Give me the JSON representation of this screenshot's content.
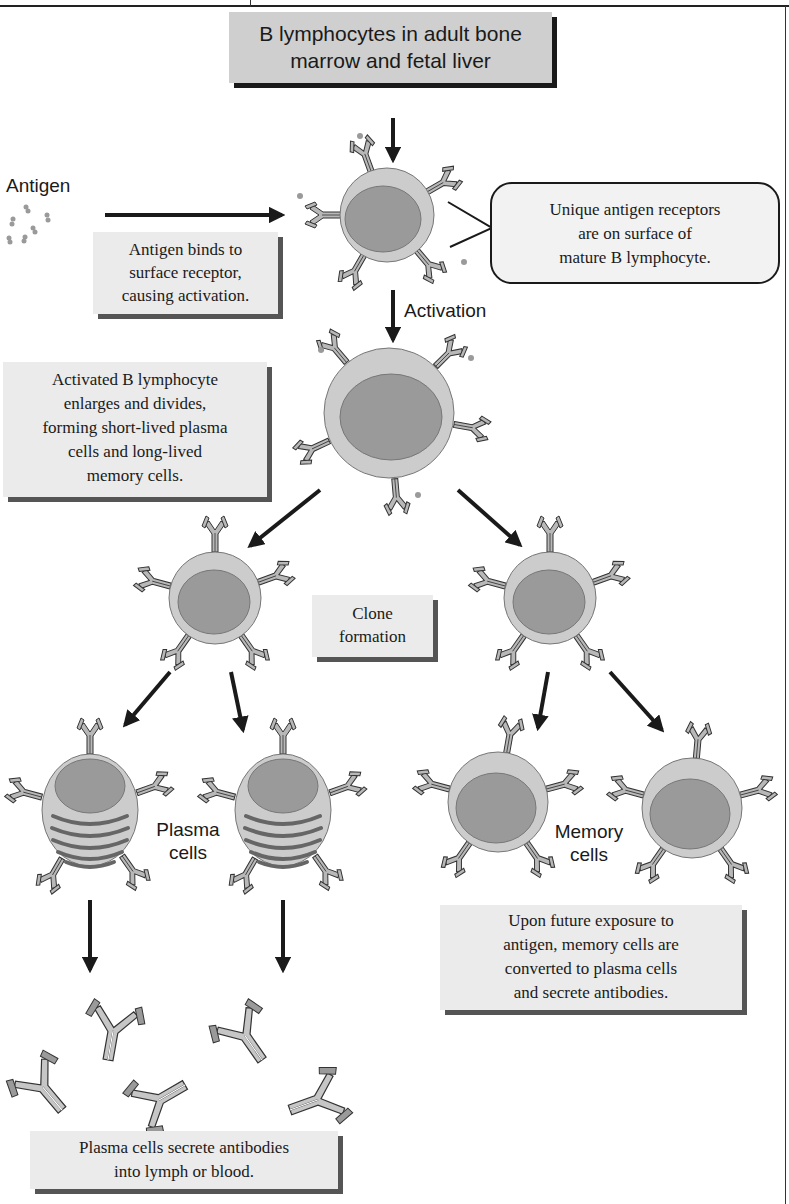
{
  "diagram": {
    "title_box": "B lymphocytes in adult bone marrow and fetal liver",
    "title_box_lines": [
      "B lymphocytes in adult bone",
      "marrow and fetal liver"
    ],
    "antigen_label": "Antigen",
    "antigen_binds_box": [
      "Antigen binds to",
      "surface receptor,",
      "causing activation."
    ],
    "unique_receptors_callout": [
      "Unique antigen receptors",
      "are on surface of",
      "mature B lymphocyte."
    ],
    "activation_label": "Activation",
    "activated_box": [
      "Activated B lymphocyte",
      "enlarges and divides,",
      "forming short-lived plasma",
      "cells and long-lived",
      "memory cells."
    ],
    "clone_box": [
      "Clone",
      "formation"
    ],
    "plasma_label": [
      "Plasma",
      "cells"
    ],
    "memory_label": [
      "Memory",
      "cells"
    ],
    "memory_future_box": [
      "Upon future exposure to",
      "antigen, memory cells are",
      "converted to plasma cells",
      "and secrete antibodies."
    ],
    "plasma_secrete_box": [
      "Plasma cells secrete antibodies",
      "into lymph or blood."
    ]
  },
  "nodes": [
    {
      "id": "precursor",
      "label": "B lymphocytes in adult bone marrow and fetal liver"
    },
    {
      "id": "mature_b",
      "label": "Mature B lymphocyte"
    },
    {
      "id": "activated_b",
      "label": "Activated B lymphocyte"
    },
    {
      "id": "clone_left",
      "label": "Clone cell"
    },
    {
      "id": "clone_right",
      "label": "Clone cell"
    },
    {
      "id": "plasma_1",
      "label": "Plasma cell"
    },
    {
      "id": "plasma_2",
      "label": "Plasma cell"
    },
    {
      "id": "memory_1",
      "label": "Memory cell"
    },
    {
      "id": "memory_2",
      "label": "Memory cell"
    },
    {
      "id": "antibodies",
      "label": "Antibodies"
    }
  ],
  "edges": [
    {
      "from": "precursor",
      "to": "mature_b"
    },
    {
      "from": "antigen",
      "to": "mature_b"
    },
    {
      "from": "mature_b",
      "to": "activated_b",
      "label": "Activation"
    },
    {
      "from": "activated_b",
      "to": "clone_left"
    },
    {
      "from": "activated_b",
      "to": "clone_right"
    },
    {
      "from": "clone_left",
      "to": "plasma_1"
    },
    {
      "from": "clone_left",
      "to": "plasma_2"
    },
    {
      "from": "clone_right",
      "to": "memory_1"
    },
    {
      "from": "clone_right",
      "to": "memory_2"
    },
    {
      "from": "plasma_1",
      "to": "antibodies"
    },
    {
      "from": "plasma_2",
      "to": "antibodies"
    }
  ],
  "colors": {
    "cell_cytoplasm": "#c9c9c9",
    "cell_nucleus": "#9a9a9a",
    "box_gray": "#cfcfcf",
    "box_light": "#ebebeb",
    "arrow": "#1a1a1a"
  }
}
